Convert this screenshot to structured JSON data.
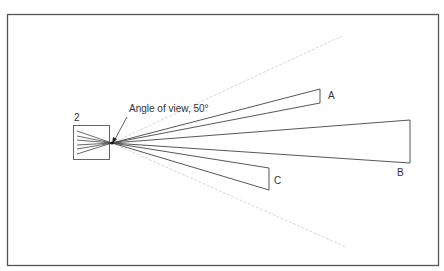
{
  "diagram": {
    "box_label": "2",
    "annotation": "Angle of view, 50°",
    "wedges": [
      {
        "id": "A",
        "label": "A"
      },
      {
        "id": "B",
        "label": "B"
      },
      {
        "id": "C",
        "label": "C"
      }
    ],
    "colors": {
      "line": "#444444",
      "faint": "#d0d0d0",
      "frame": "#555555"
    }
  }
}
